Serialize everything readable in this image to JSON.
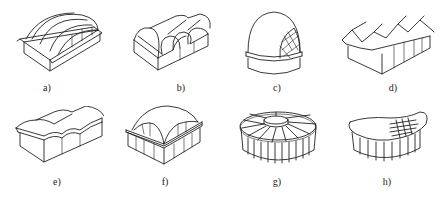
{
  "figure": {
    "panels": [
      {
        "id": "a",
        "label": "a)",
        "description": "cylindrical shell roof with multiple barrel vaults over open box structure"
      },
      {
        "id": "b",
        "label": "b)",
        "description": "series of parallel barrel vaults with arched openings"
      },
      {
        "id": "c",
        "label": "c)",
        "description": "dome with lattice/grid-shell section on cylindrical drum"
      },
      {
        "id": "d",
        "label": "d)",
        "description": "folded plate roof with zigzag profile"
      },
      {
        "id": "e",
        "label": "e)",
        "description": "wave-shaped shell roof"
      },
      {
        "id": "f",
        "label": "f)",
        "description": "square-based dome shell with edge beams on colonnade"
      },
      {
        "id": "g",
        "label": "g)",
        "description": "radial cable-suspended roof with central ring on cylindrical base"
      },
      {
        "id": "h",
        "label": "h)",
        "description": "saddle-shaped cable net roof over curved base"
      }
    ]
  }
}
